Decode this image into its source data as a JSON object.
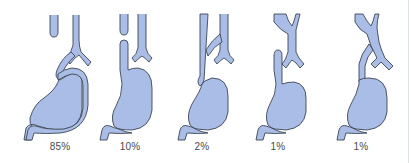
{
  "diagram": {
    "colors": {
      "organ_fill": "#a9bde6",
      "outline": "#3d4656",
      "label": "#4a4a4a"
    },
    "figures": [
      {
        "id": "type-1",
        "label": "85%"
      },
      {
        "id": "type-2",
        "label": "10%"
      },
      {
        "id": "type-3",
        "label": "2%"
      },
      {
        "id": "type-4",
        "label": "1%"
      },
      {
        "id": "type-5",
        "label": "1%"
      }
    ]
  }
}
